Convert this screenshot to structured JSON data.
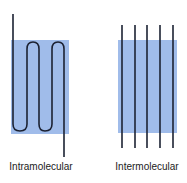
{
  "diagram": {
    "colors": {
      "box_fill": "#8fb0e6",
      "strand": "#1c2233"
    },
    "panels": [
      {
        "id": "intramolecular",
        "label": "Intramolecular"
      },
      {
        "id": "intermolecular",
        "label": "Intermolecular"
      }
    ]
  }
}
